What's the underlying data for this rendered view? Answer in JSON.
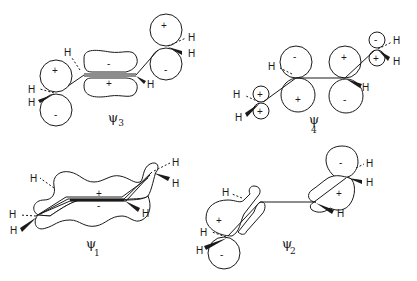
{
  "orbitals": {
    "psi3": {
      "label": "ψ",
      "subscript": "3",
      "signs": {
        "left_top": "+",
        "left_bottom": "-",
        "center_top": "-",
        "center_bottom": "+",
        "right_top": "+",
        "right_bottom": "-"
      }
    },
    "psi4": {
      "label": "ψ",
      "subscript": "4",
      "signs": {
        "c1_top": "+",
        "c1_bottom": "+",
        "c2_top": "-",
        "c2_bottom": "+",
        "c3_top": "+",
        "c3_bottom": "-",
        "c4_top": "-",
        "c4_bottom": "+"
      }
    },
    "psi1": {
      "label": "ψ",
      "subscript": "1",
      "signs": {
        "top": "+",
        "bottom": "-"
      }
    },
    "psi2": {
      "label": "ψ",
      "subscript": "2",
      "signs": {
        "left_top": "+",
        "left_bottom": "-",
        "right_top": "-",
        "right_bottom": "+"
      }
    }
  },
  "atom_label": "H"
}
